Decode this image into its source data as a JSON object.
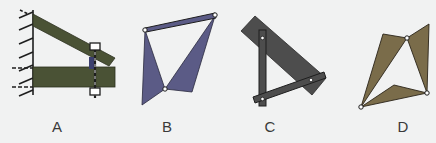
{
  "figures": [
    {
      "id": "A",
      "label": "A",
      "description": "Wall-mounted bracket with slanted strut bolted to horizontal beam",
      "colors": {
        "member": "#4a5235",
        "bolt_fill": "#3b3f6e"
      }
    },
    {
      "id": "B",
      "label": "B",
      "description": "Two triangular plates pinned together with a top link bar",
      "colors": {
        "member": "#5b5b86"
      }
    },
    {
      "id": "C",
      "label": "C",
      "description": "Rectangular plate with two pinned bars forming a triangle",
      "colors": {
        "member": "#4d4d4d"
      }
    },
    {
      "id": "D",
      "label": "D",
      "description": "Three triangular plates pinned at three joints",
      "colors": {
        "member": "#7a6c4a"
      }
    }
  ],
  "colors": {
    "background": "#f1f2f2",
    "outline": "#1e1e1e",
    "pin": "#ffffff",
    "label": "#3a3a3a"
  }
}
